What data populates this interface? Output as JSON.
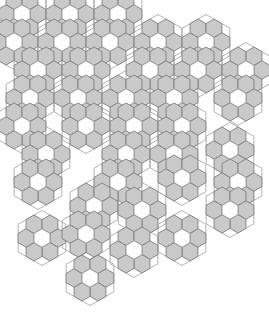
{
  "figure": {
    "title": "Hexagonal Rosette Tiling",
    "type": "geometric-tiling-diagram",
    "canvas": {
      "width": 269,
      "height": 313,
      "background": "#ffffff"
    }
  },
  "palette": {
    "background": "#ffffff",
    "hex_fill": "#c9c9c9",
    "hex_stroke": "#7f7f7f",
    "center_fill": "#ffffff",
    "center_stroke": "#9a9a9a",
    "tile_outline_stroke": "#a9a9a9",
    "tile_outline_fill": "none"
  },
  "motif": {
    "name": "rosette",
    "description": "six gray hexagons ringing one white hexagon, inscribed in a hexagonal tile outline",
    "gray_hex_count": 6,
    "white_hex_count": 1,
    "cell_hex_radius": 9.2,
    "hex_orientation": "pointy-top",
    "tile_outline_radius": 27.5,
    "tile_outline_orientation": "pointy-top",
    "stroke_width_hex": 0.9,
    "stroke_width_outline": 0.9
  },
  "lattice": {
    "description": "staggered rows of rosettes forming diagonal bands separated by white gaps",
    "row_step_y": 27.6,
    "col_step_x": 47.8,
    "row_shift_x": 15.9,
    "rosette_count": 38
  },
  "rosettes": [
    {
      "id": "r00",
      "cx": 22,
      "cy": 14,
      "outline": true
    },
    {
      "id": "r01",
      "cx": 70,
      "cy": 14,
      "outline": true
    },
    {
      "id": "r02",
      "cx": 118,
      "cy": 14,
      "outline": true
    },
    {
      "id": "r10",
      "cx": 14,
      "cy": 42,
      "outline": true
    },
    {
      "id": "r11",
      "cx": 62,
      "cy": 42,
      "outline": true
    },
    {
      "id": "r12",
      "cx": 110,
      "cy": 42,
      "outline": true
    },
    {
      "id": "r13",
      "cx": 158,
      "cy": 42,
      "outline": true
    },
    {
      "id": "r14",
      "cx": 206,
      "cy": 42,
      "outline": true
    },
    {
      "id": "r20",
      "cx": 38,
      "cy": 70,
      "outline": true
    },
    {
      "id": "r21",
      "cx": 86,
      "cy": 70,
      "outline": true
    },
    {
      "id": "r22",
      "cx": 150,
      "cy": 70,
      "outline": true
    },
    {
      "id": "r23",
      "cx": 198,
      "cy": 70,
      "outline": true
    },
    {
      "id": "r24",
      "cx": 246,
      "cy": 70,
      "outline": true
    },
    {
      "id": "r30",
      "cx": 30,
      "cy": 98,
      "outline": true
    },
    {
      "id": "r31",
      "cx": 78,
      "cy": 98,
      "outline": true
    },
    {
      "id": "r32",
      "cx": 126,
      "cy": 98,
      "outline": true
    },
    {
      "id": "r33",
      "cx": 174,
      "cy": 98,
      "outline": true
    },
    {
      "id": "r34",
      "cx": 238,
      "cy": 98,
      "outline": true
    },
    {
      "id": "r40",
      "cx": 22,
      "cy": 126,
      "outline": true
    },
    {
      "id": "r41",
      "cx": 86,
      "cy": 126,
      "outline": true
    },
    {
      "id": "r42",
      "cx": 134,
      "cy": 126,
      "outline": true
    },
    {
      "id": "r43",
      "cx": 182,
      "cy": 126,
      "outline": true
    },
    {
      "id": "r50",
      "cx": 46,
      "cy": 154,
      "outline": true
    },
    {
      "id": "r51",
      "cx": 126,
      "cy": 154,
      "outline": true
    },
    {
      "id": "r52",
      "cx": 174,
      "cy": 154,
      "outline": true
    },
    {
      "id": "r53",
      "cx": 230,
      "cy": 150,
      "outline": true
    },
    {
      "id": "r60",
      "cx": 38,
      "cy": 182,
      "outline": true
    },
    {
      "id": "r61",
      "cx": 118,
      "cy": 182,
      "outline": true
    },
    {
      "id": "r62",
      "cx": 182,
      "cy": 178,
      "outline": true
    },
    {
      "id": "r63",
      "cx": 238,
      "cy": 182,
      "outline": true
    },
    {
      "id": "r70",
      "cx": 94,
      "cy": 206,
      "outline": true
    },
    {
      "id": "r71",
      "cx": 142,
      "cy": 210,
      "outline": true
    },
    {
      "id": "r72",
      "cx": 230,
      "cy": 210,
      "outline": true
    },
    {
      "id": "r80",
      "cx": 42,
      "cy": 238,
      "outline": true
    },
    {
      "id": "r81",
      "cx": 86,
      "cy": 234,
      "outline": true
    },
    {
      "id": "r82",
      "cx": 182,
      "cy": 238,
      "outline": true
    },
    {
      "id": "r90",
      "cx": 134,
      "cy": 250,
      "outline": true
    },
    {
      "id": "r91",
      "cx": 90,
      "cy": 278,
      "outline": true
    }
  ]
}
